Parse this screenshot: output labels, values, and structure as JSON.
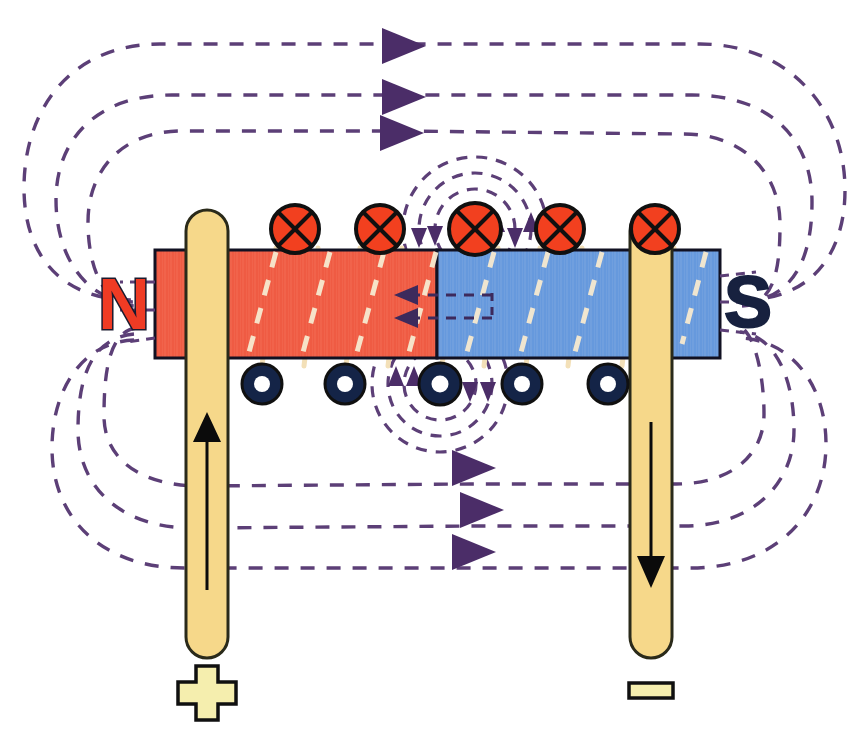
{
  "figure": {
    "background_color": "#ffffff",
    "width": 860,
    "height": 752
  },
  "magnet_bar": {
    "name": "magnetized core bar",
    "x": 155,
    "y": 250,
    "width": 565,
    "height": 108,
    "north_half": {
      "label": "N",
      "color": "#ef5b43",
      "x": 155,
      "width": 282
    },
    "south_half": {
      "label": "S",
      "color": "#6699dd",
      "x": 437,
      "width": 283
    },
    "outline_color": "#111122"
  },
  "pole_labels": {
    "north": {
      "text": "N",
      "color": "#ef3b24",
      "outline_color": "#1a1a2e",
      "x": 98,
      "y": 268
    },
    "south": {
      "text": "S",
      "color": "#17213f",
      "outline_color": "#17213f",
      "x": 724,
      "y": 266
    }
  },
  "conductors": [
    {
      "name": "left-lead-positive",
      "x": 186,
      "y": 210,
      "width": 42,
      "height": 448,
      "color": "#f6d88a",
      "outline_color": "#2a2a1a",
      "current_direction": "up",
      "terminal_symbol": "+"
    },
    {
      "name": "right-lead-negative",
      "x": 630,
      "y": 210,
      "width": 42,
      "height": 448,
      "color": "#f6d88a",
      "outline_color": "#2a2a1a",
      "current_direction": "down",
      "terminal_symbol": "−"
    }
  ],
  "terminals": [
    {
      "name": "positive-terminal",
      "symbol": "+",
      "cx": 207,
      "cy": 693,
      "fill": "#f5eeae",
      "outline": "#101010"
    },
    {
      "name": "negative-terminal",
      "symbol": "−",
      "cx": 651,
      "cy": 690,
      "fill": "#f5eeae",
      "outline": "#101010"
    }
  ],
  "coil_current_into_page": {
    "name": "current into page markers (top of core)",
    "symbol": "x-in-circle",
    "fill": "#f2401f",
    "stroke": "#101010",
    "radius": 24,
    "cy": 229,
    "positions": [
      295,
      380,
      475,
      560,
      655
    ]
  },
  "coil_current_out_of_page": {
    "name": "current out of page markers (bottom of core)",
    "symbol": "dot-in-circle",
    "fill": "#142447",
    "inner_fill": "#ffffff",
    "stroke": "#101010",
    "radius": 20,
    "inner_radius": 8,
    "cy": 384,
    "positions": [
      262,
      345,
      440,
      522,
      608
    ]
  },
  "coil_windings": {
    "name": "coil wire wrap segments",
    "color": "#f3e0b8",
    "stroke_width": 4,
    "count": 5
  },
  "field_lines": {
    "name": "external magnetic field loops",
    "color": "#5c3f77",
    "dash": "14 12",
    "stroke_width": 3.4,
    "arrowhead_color": "#4b2d68",
    "top_loop_arrows": [
      {
        "x": 400,
        "y": 46
      },
      {
        "x": 400,
        "y": 97
      },
      {
        "x": 398,
        "y": 133
      }
    ],
    "bottom_loop_arrows": [
      {
        "x": 470,
        "y": 466
      },
      {
        "x": 478,
        "y": 512
      },
      {
        "x": 470,
        "y": 553
      }
    ],
    "loop_count_per_side": 3
  },
  "interior_field_arrows": {
    "name": "interior field direction arrows",
    "color": "#3d2a5c",
    "direction": "left",
    "arrows": [
      {
        "x": 404,
        "y": 295
      },
      {
        "x": 404,
        "y": 318
      }
    ]
  },
  "circular_field_top": {
    "name": "circular field around top conductor",
    "center": {
      "x": 475,
      "y": 229
    },
    "radii": [
      40,
      56,
      72
    ],
    "color": "#5c3f77",
    "rotation_sense": "clockwise"
  },
  "circular_field_bottom": {
    "name": "circular field around bottom conductor",
    "center": {
      "x": 440,
      "y": 384
    },
    "radii": [
      36,
      52,
      68
    ],
    "color": "#5c3f77",
    "rotation_sense": "counterclockwise"
  },
  "colors": {
    "field_purple": "#5c3f77",
    "north_red": "#ef5b43",
    "south_blue": "#6699dd",
    "wire_tan": "#f6d88a",
    "into_page_orange": "#f2401f",
    "out_of_page_navy": "#142447",
    "outline_black": "#111122"
  }
}
